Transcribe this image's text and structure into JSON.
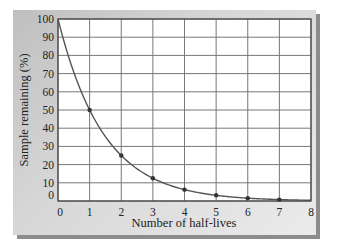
{
  "chart_data": {
    "type": "line",
    "title": "",
    "xlabel": "Number of half-lives",
    "ylabel": "Sample remaining (%)",
    "x": [
      0,
      1,
      2,
      3,
      4,
      5,
      6,
      7,
      8
    ],
    "series": [
      {
        "name": "Sample remaining",
        "values": [
          100,
          50,
          25,
          12.5,
          6.25,
          3.125,
          1.5625,
          0.78125,
          0.390625
        ]
      }
    ],
    "markers_at_x": [
      1,
      2,
      3,
      4,
      5,
      6,
      7
    ],
    "xlim": [
      0,
      8
    ],
    "ylim": [
      0,
      100
    ],
    "xticks": [
      "0",
      "1",
      "2",
      "3",
      "4",
      "5",
      "6",
      "7",
      "8"
    ],
    "yticks": [
      "0",
      "10",
      "20",
      "30",
      "40",
      "50",
      "60",
      "70",
      "80",
      "90",
      "100"
    ],
    "grid": true,
    "legend": "none",
    "colors": {
      "line": "#555555",
      "grid": "#777777",
      "panel": "#d0d0d0",
      "plot_bg": "#ffffff"
    }
  }
}
